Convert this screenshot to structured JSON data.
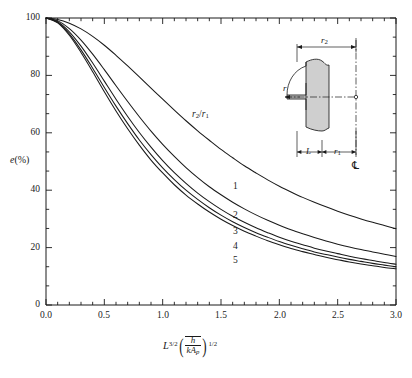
{
  "figure": {
    "type": "line-chart",
    "ylabel_e": "e",
    "ylabel_pct": "(%)",
    "xlabel_L": "L",
    "xlabel_L_exp": "3/2",
    "xlabel_num": "h",
    "xlabel_den_k": "k",
    "xlabel_den_A": "A",
    "xlabel_den_sub": "p",
    "xlabel_outer_exp": "1/2",
    "legend_title_r": "r",
    "legend_title_sub2": "2",
    "legend_title_slash": "/",
    "legend_title_r1": "r",
    "legend_title_sub1": "1"
  },
  "axes": {
    "x_ticks": [
      "0.0",
      "0.5",
      "1.0",
      "1.5",
      "2.0",
      "2.5",
      "3.0"
    ],
    "y_ticks": [
      "0",
      "20",
      "40",
      "60",
      "80",
      "100"
    ],
    "xlim": [
      0,
      3
    ],
    "ylim": [
      0,
      100
    ],
    "x_minor_count": 4,
    "y_minor_count": 2
  },
  "inset": {
    "label_r2": "r",
    "label_r2_sub": "2",
    "label_r1": "r",
    "label_r1_sub": "1",
    "label_L": "L",
    "label_r": "r",
    "label_centerline": "℄"
  },
  "curve_labels": [
    "1",
    "2",
    "3",
    "4",
    "5"
  ],
  "chart_data": {
    "type": "line",
    "title": "",
    "xlabel": "L^(3/2) (h̄/(kA_p))^(1/2)",
    "ylabel": "e(%)",
    "xlim": [
      0,
      3
    ],
    "ylim": [
      0,
      100
    ],
    "grid": false,
    "legend_position": "inline-curve-labels",
    "legend_title": "r2/r1",
    "x": [
      0,
      0.1,
      0.2,
      0.3,
      0.4,
      0.5,
      0.6,
      0.7,
      0.8,
      0.9,
      1.0,
      1.1,
      1.2,
      1.3,
      1.4,
      1.5,
      1.6,
      1.7,
      1.8,
      1.9,
      2.0,
      2.1,
      2.2,
      2.3,
      2.4,
      2.5,
      2.6,
      2.7,
      2.8,
      2.9,
      3.0
    ],
    "series": [
      {
        "name": "1",
        "r2_over_r1": 1,
        "values": [
          100,
          99.5,
          98.2,
          96.2,
          93.6,
          90.5,
          87.0,
          83.3,
          79.5,
          75.6,
          71.7,
          67.9,
          64.2,
          60.7,
          57.4,
          54.2,
          51.3,
          48.5,
          46.0,
          43.6,
          41.4,
          39.4,
          37.5,
          35.8,
          34.2,
          32.7,
          31.3,
          30.0,
          28.8,
          27.7,
          26.6
        ]
      },
      {
        "name": "2",
        "r2_over_r1": 2,
        "values": [
          100,
          99.0,
          96.3,
          92.3,
          87.4,
          82.0,
          76.4,
          70.9,
          65.6,
          60.6,
          56.0,
          51.8,
          47.9,
          44.4,
          41.2,
          38.4,
          35.8,
          33.5,
          31.4,
          29.5,
          27.8,
          26.2,
          24.8,
          23.5,
          22.3,
          21.2,
          20.2,
          19.3,
          18.5,
          17.7,
          16.9
        ]
      },
      {
        "name": "3",
        "r2_over_r1": 3,
        "values": [
          100,
          98.7,
          95.2,
          90.2,
          84.3,
          78.0,
          71.7,
          65.7,
          60.1,
          55.0,
          50.3,
          46.1,
          42.4,
          39.0,
          36.0,
          33.3,
          30.9,
          28.8,
          26.9,
          25.2,
          23.6,
          22.2,
          21.0,
          19.8,
          18.8,
          17.9,
          17.0,
          16.2,
          15.5,
          14.8,
          14.2
        ]
      },
      {
        "name": "4",
        "r2_over_r1": 4,
        "values": [
          100,
          98.5,
          94.5,
          88.9,
          82.5,
          75.8,
          69.3,
          63.2,
          57.5,
          52.4,
          47.8,
          43.7,
          40.0,
          36.8,
          33.9,
          31.3,
          29.0,
          27.0,
          25.2,
          23.6,
          22.1,
          20.8,
          19.6,
          18.5,
          17.6,
          16.7,
          15.9,
          15.2,
          14.5,
          13.9,
          13.3
        ]
      },
      {
        "name": "5",
        "r2_over_r1": 5,
        "values": [
          100,
          98.3,
          94.0,
          88.0,
          81.3,
          74.3,
          67.6,
          61.4,
          55.7,
          50.5,
          46.0,
          41.9,
          38.3,
          35.2,
          32.4,
          29.9,
          27.7,
          25.7,
          24.0,
          22.4,
          21.0,
          19.7,
          18.6,
          17.6,
          16.6,
          15.8,
          15.0,
          14.3,
          13.7,
          13.1,
          12.6
        ]
      }
    ]
  },
  "colors": {
    "line": "#1a1a1a",
    "axis": "#1a1a1a",
    "fin_fill": "#cfcfcf",
    "background": "#ffffff"
  }
}
